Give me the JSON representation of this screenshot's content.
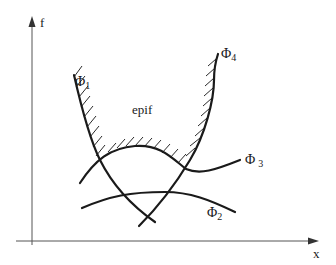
{
  "diagram": {
    "axes": {
      "y_label": "f",
      "x_label": "x"
    },
    "region_label": "epif",
    "curves": [
      {
        "id": "phi1",
        "label": "Φ",
        "subscript": "1"
      },
      {
        "id": "phi2",
        "label": "Φ",
        "subscript": "2"
      },
      {
        "id": "phi3",
        "label": "Φ",
        "subscript": "3"
      },
      {
        "id": "phi4",
        "label": "Φ",
        "subscript": "4"
      }
    ],
    "colors": {
      "ink": "#1a1a1a",
      "axis": "#555555",
      "background": "#ffffff"
    }
  }
}
